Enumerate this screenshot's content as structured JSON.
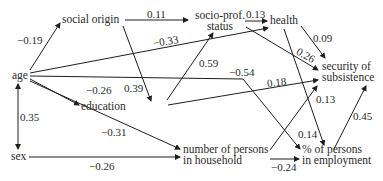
{
  "diagram": {
    "type": "path-diagram",
    "nodes": {
      "social_origin": "social origin",
      "socio_prof_status_l1": "socio-prof.",
      "socio_prof_status_l2": "status",
      "health": "health",
      "security_l1": "security of",
      "security_l2": "subsistence",
      "age": "age",
      "education": "education",
      "sex": "sex",
      "household_l1": "number of persons",
      "household_l2": "in household",
      "employment_l1": "% of persons",
      "employment_l2": "in employment"
    },
    "edges": [
      {
        "from": "age",
        "to": "social origin",
        "coef": "−0.19"
      },
      {
        "from": "social origin",
        "to": "socio-prof. status",
        "coef": "0.11"
      },
      {
        "from": "social origin",
        "to": "education",
        "coef": "0.39"
      },
      {
        "from": "socio-prof. status",
        "to": "health",
        "coef": "0.13"
      },
      {
        "from": "socio-prof. status",
        "to": "security of subsistence",
        "coef": "0.26"
      },
      {
        "from": "age",
        "to": "health",
        "coef": "−0.33"
      },
      {
        "from": "education",
        "to": "socio-prof. status",
        "coef": "0.59"
      },
      {
        "from": "age",
        "to": "% of persons in employment",
        "coef": "−0.54"
      },
      {
        "from": "education",
        "to": "security of subsistence",
        "coef": "0.18"
      },
      {
        "from": "health",
        "to": "security of subsistence",
        "coef": "0.09"
      },
      {
        "from": "health",
        "to": "% of persons in employment",
        "coef": "0.14"
      },
      {
        "from": "age",
        "to": "education",
        "coef": "−0.26"
      },
      {
        "from": "age",
        "to": "number of persons in household",
        "coef": "−0.31"
      },
      {
        "from": "age",
        "to": "sex",
        "coef": "0.35",
        "bidirectional": true
      },
      {
        "from": "sex",
        "to": "number of persons in household",
        "coef": "−0.26"
      },
      {
        "from": "number of persons in household",
        "to": "security of subsistence",
        "coef": "0.13"
      },
      {
        "from": "% of persons in employment",
        "to": "security of subsistence",
        "coef": "0.45"
      },
      {
        "from": "number of persons in household",
        "to": "% of persons in employment",
        "coef": "−0.24"
      }
    ],
    "coefs": {
      "age_social": "−0.19",
      "social_sps": "0.11",
      "social_edu": "0.39",
      "sps_health": "0.13",
      "sps_security": "0.26",
      "age_health": "−0.33",
      "edu_sps": "0.59",
      "age_employment": "−0.54",
      "edu_security": "0.18",
      "health_security": "0.09",
      "health_employment": "0.14",
      "age_edu": "−0.26",
      "age_household": "−0.31",
      "age_sex": "0.35",
      "sex_household": "−0.26",
      "household_security": "0.13",
      "employment_security": "0.45",
      "household_employment": "−0.24"
    },
    "line_color": "#1e1e1e",
    "text_color": "#2a2a2a"
  }
}
